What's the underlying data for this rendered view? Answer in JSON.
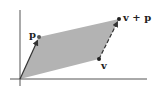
{
  "diagram": {
    "colors": {
      "fill": "#b3b3b3",
      "stroke": "#333333",
      "axis": "#555555",
      "background": "#ffffff"
    },
    "axes": {
      "origin": [
        20,
        79
      ],
      "x_axis": {
        "from": [
          10,
          79
        ],
        "to": [
          147,
          79
        ]
      },
      "y_axis": {
        "from": [
          20,
          10
        ],
        "to": [
          20,
          86
        ]
      }
    },
    "points": {
      "p": {
        "label": "p",
        "pos": [
          39,
          37
        ],
        "label_pos": [
          29,
          30
        ]
      },
      "v": {
        "label": "v",
        "pos": [
          99,
          59
        ],
        "label_pos": [
          101,
          61
        ]
      },
      "v_plus_p": {
        "label": "v + p",
        "pos": [
          119,
          19
        ],
        "label_pos": [
          123,
          13
        ]
      }
    },
    "arrows": [
      {
        "name": "vector-p",
        "from": [
          20,
          79
        ],
        "to": [
          39,
          37
        ],
        "style": "solid"
      },
      {
        "name": "vector-p-translated",
        "from": [
          99,
          59
        ],
        "to": [
          119,
          19
        ],
        "style": "dashed"
      }
    ]
  }
}
